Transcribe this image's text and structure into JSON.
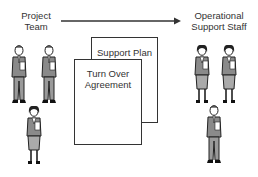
{
  "diagram": {
    "source": {
      "label_line1": "Project",
      "label_line2": "Team"
    },
    "target": {
      "label_line1": "Operational",
      "label_line2": "Support Staff"
    },
    "arrow": {
      "direction": "left-to-right"
    },
    "documents": [
      {
        "name": "Support Plan",
        "text": "Support Plan"
      },
      {
        "name": "Turn Over Agreement",
        "text_line1": "Turn Over",
        "text_line2": "Agreement"
      }
    ],
    "people": {
      "project_team": [
        "man",
        "man",
        "woman"
      ],
      "operational_support_staff": [
        "woman",
        "woman",
        "man"
      ]
    }
  },
  "colors": {
    "line": "#333333",
    "figure_fill": "#8a8a8a",
    "background": "#ffffff"
  }
}
